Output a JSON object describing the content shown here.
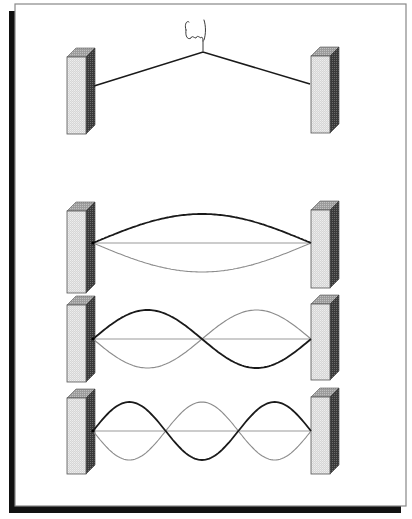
{
  "diagram": {
    "title": "",
    "colors": {
      "background": "#ffffff",
      "frame_border": "#888888",
      "frame_shadow": "#111111",
      "post_front": "#dcdcdc",
      "post_top": "#a9a9a9",
      "post_side": "#4a4a4a",
      "string_dark": "#1a1a1a",
      "string_light": "#8c8c8c",
      "axis": "#9a9a9a"
    },
    "frame": {
      "x": 15,
      "y": 4,
      "width": 391,
      "height": 502,
      "shadow_offset": 7
    },
    "plucked_panel": {
      "label": "",
      "icon": "plucking-hand-icon",
      "left_post": {
        "x": 67,
        "y": 57,
        "w": 19,
        "h": 77
      },
      "right_post": {
        "x": 311,
        "y": 56,
        "w": 19,
        "h": 77
      },
      "string": {
        "left": [
          94,
          86
        ],
        "apex": [
          203,
          52
        ],
        "right": [
          310,
          84
        ]
      }
    },
    "modes": [
      {
        "name": "mode-1-fundamental",
        "harmonic": 1,
        "axis_y": 243,
        "amplitude": 29,
        "x_start": 93,
        "x_end": 311,
        "left_post": {
          "x": 67,
          "y": 211,
          "w": 19,
          "h": 82
        },
        "right_post": {
          "x": 311,
          "y": 210,
          "w": 19,
          "h": 78
        }
      },
      {
        "name": "mode-2-second-harmonic",
        "harmonic": 2,
        "axis_y": 339,
        "amplitude": 29,
        "x_start": 93,
        "x_end": 311,
        "left_post": {
          "x": 67,
          "y": 305,
          "w": 19,
          "h": 77
        },
        "right_post": {
          "x": 311,
          "y": 304,
          "w": 19,
          "h": 76
        }
      },
      {
        "name": "mode-3-third-harmonic",
        "harmonic": 3,
        "axis_y": 431,
        "amplitude": 29,
        "x_start": 93,
        "x_end": 311,
        "left_post": {
          "x": 67,
          "y": 398,
          "w": 19,
          "h": 76
        },
        "right_post": {
          "x": 311,
          "y": 397,
          "w": 19,
          "h": 77
        }
      }
    ]
  }
}
